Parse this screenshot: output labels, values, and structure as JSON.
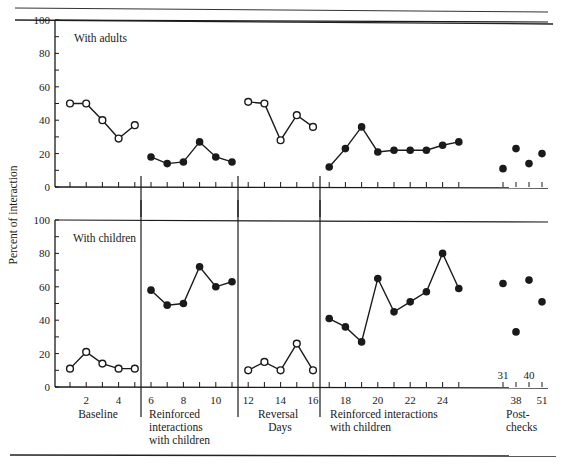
{
  "chart_data": {
    "type": "line",
    "title": "",
    "ylabel": "Percent of interaction",
    "xlabel": "Days",
    "ylim": [
      0,
      100
    ],
    "yticks": [
      0,
      20,
      40,
      60,
      80,
      100
    ],
    "xtick_labels": [
      "2",
      "4",
      "6",
      "8",
      "10",
      "12",
      "14",
      "16",
      "18",
      "20",
      "22",
      "24",
      "38",
      "51"
    ],
    "postcheck_upper_labels": [
      "31",
      "40"
    ],
    "phases": [
      {
        "name": "Baseline",
        "days": [
          1,
          5
        ]
      },
      {
        "name": "Reinforced interactions with children",
        "days": [
          6,
          11
        ]
      },
      {
        "name": "Reversal",
        "days": [
          12,
          16
        ]
      },
      {
        "name": "Reinforced interactions with children",
        "days": [
          17,
          25
        ]
      },
      {
        "name": "Post-checks",
        "days": [
          31,
          38,
          40,
          51
        ]
      }
    ],
    "panels": [
      {
        "title": "With adults",
        "series": [
          {
            "name": "Baseline",
            "marker": "open",
            "x": [
              1,
              2,
              3,
              4,
              5
            ],
            "values": [
              50,
              50,
              40,
              29,
              37
            ]
          },
          {
            "name": "Reinforced interactions with children (1)",
            "marker": "filled",
            "x": [
              6,
              7,
              8,
              9,
              10,
              11
            ],
            "values": [
              18,
              14,
              15,
              27,
              18,
              15
            ]
          },
          {
            "name": "Reversal",
            "marker": "open",
            "x": [
              12,
              13,
              14,
              15,
              16
            ],
            "values": [
              51,
              50,
              28,
              43,
              36
            ]
          },
          {
            "name": "Reinforced interactions with children (2)",
            "marker": "filled",
            "x": [
              17,
              18,
              19,
              20,
              21,
              22,
              23,
              24,
              25
            ],
            "values": [
              12,
              23,
              36,
              21,
              22,
              22,
              22,
              25,
              27
            ]
          },
          {
            "name": "Post-checks",
            "marker": "filled",
            "connected": false,
            "x": [
              31,
              38,
              40,
              51
            ],
            "values": [
              11,
              23,
              14,
              20
            ]
          }
        ]
      },
      {
        "title": "With children",
        "series": [
          {
            "name": "Baseline",
            "marker": "open",
            "x": [
              1,
              2,
              3,
              4,
              5
            ],
            "values": [
              11,
              21,
              14,
              11,
              11
            ]
          },
          {
            "name": "Reinforced interactions with children (1)",
            "marker": "filled",
            "x": [
              6,
              7,
              8,
              9,
              10,
              11
            ],
            "values": [
              58,
              49,
              50,
              72,
              60,
              63
            ]
          },
          {
            "name": "Reversal",
            "marker": "open",
            "x": [
              12,
              13,
              14,
              15,
              16
            ],
            "values": [
              10,
              15,
              10,
              26,
              10
            ]
          },
          {
            "name": "Reinforced interactions with children (2)",
            "marker": "filled",
            "x": [
              17,
              18,
              19,
              20,
              21,
              22,
              23,
              24,
              25
            ],
            "values": [
              41,
              36,
              27,
              65,
              45,
              51,
              57,
              80,
              59
            ]
          },
          {
            "name": "Post-checks",
            "marker": "filled",
            "connected": false,
            "x": [
              31,
              38,
              40,
              51
            ],
            "values": [
              62,
              33,
              64,
              51
            ]
          }
        ]
      }
    ],
    "legend": "none",
    "grid": false
  },
  "labels": {
    "ylabel": "Percent of interaction",
    "xlabel": "Days",
    "panel_top": "With adults",
    "panel_bottom": "With children",
    "phase_baseline": "Baseline",
    "phase_reinforced1_line1": "Reinforced",
    "phase_reinforced1_line2": "interactions",
    "phase_reinforced1_line3": "with children",
    "phase_reversal": "Reversal",
    "phase_reinforced2_line1": "Reinforced interactions",
    "phase_reinforced2_line2": "with children",
    "phase_post_line1": "Post-",
    "phase_post_line2": "checks"
  }
}
